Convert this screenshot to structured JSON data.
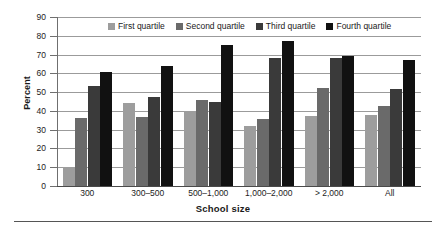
{
  "chart_data": {
    "type": "bar",
    "title": "",
    "xlabel": "School size",
    "ylabel": "Percent",
    "ylim": [
      0,
      90
    ],
    "ytick_step": 10,
    "yticks": [
      "0",
      "10",
      "20",
      "30",
      "40",
      "50",
      "60",
      "70",
      "80",
      "90"
    ],
    "grid": "horizontal",
    "legend_position": "top-center",
    "categories": [
      "300",
      "300–500",
      "500–1,000",
      "1,000–2,000",
      "> 2,000",
      "All"
    ],
    "series": [
      {
        "name": "First quartile",
        "color": "#9d9d9d",
        "values": [
          10,
          44,
          40,
          32,
          37.5,
          38
        ]
      },
      {
        "name": "Second quartile",
        "color": "#6a6a6a",
        "values": [
          36,
          37,
          46,
          35.5,
          52,
          42.5
        ]
      },
      {
        "name": "Third quartile",
        "color": "#3a3a3a",
        "values": [
          53,
          47.5,
          45,
          68,
          68,
          51.5
        ]
      },
      {
        "name": "Fourth quartile",
        "color": "#111111",
        "values": [
          60.5,
          64,
          75,
          77,
          69,
          67
        ]
      }
    ]
  }
}
